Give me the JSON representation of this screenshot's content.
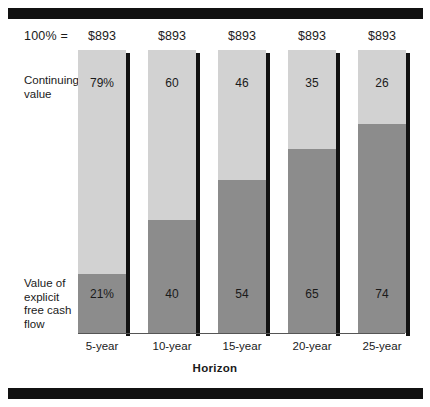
{
  "header": {
    "total_label": "100%  =",
    "totals": [
      "$893",
      "$893",
      "$893",
      "$893",
      "$893"
    ]
  },
  "legend": {
    "top_label": "Continuing value",
    "bottom_label": "Value of explicit free cash flow"
  },
  "axis": {
    "title": "Horizon"
  },
  "chart_data": {
    "type": "bar",
    "subtype": "stacked-100-percent",
    "title": "",
    "xlabel": "Horizon",
    "ylabel": "",
    "ylim": [
      0,
      100
    ],
    "grid": false,
    "legend_position": "left-inline",
    "total_label": "100%  =",
    "totals": [
      "$893",
      "$893",
      "$893",
      "$893",
      "$893"
    ],
    "categories": [
      "5-year",
      "10-year",
      "15-year",
      "20-year",
      "25-year"
    ],
    "series": [
      {
        "name": "Continuing value",
        "color": "#d2d2d2",
        "values": [
          79,
          60,
          46,
          35,
          26
        ],
        "labels": [
          "79%",
          "60",
          "46",
          "35",
          "26"
        ]
      },
      {
        "name": "Value of explicit free cash flow",
        "color": "#8c8c8c",
        "values": [
          21,
          40,
          54,
          65,
          74
        ],
        "labels": [
          "21%",
          "40",
          "54",
          "65",
          "74"
        ]
      }
    ]
  }
}
